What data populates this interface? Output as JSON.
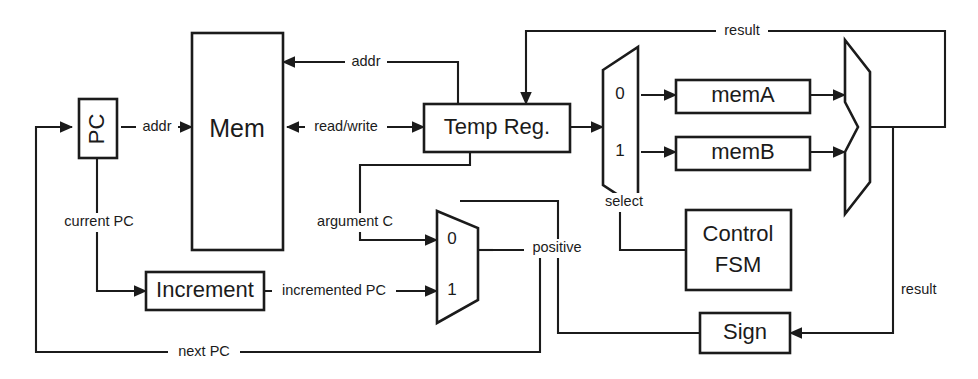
{
  "diagram": {
    "type": "block-diagram",
    "background_color": "#ffffff",
    "line_color": "#1b1b1b",
    "blocks": {
      "pc": {
        "label": "PC",
        "orientation": "vertical-text"
      },
      "mem": {
        "label": "Mem"
      },
      "increment": {
        "label": "Increment"
      },
      "temp_reg": {
        "label": "Temp Reg."
      },
      "mem_a": {
        "label": "memA"
      },
      "mem_b": {
        "label": "memB"
      },
      "control_fsm": {
        "label_line1": "Control",
        "label_line2": "FSM"
      },
      "sign": {
        "label": "Sign"
      },
      "alu": {
        "label": ""
      },
      "mux_data": {
        "input_0": "0",
        "input_1": "1",
        "control_label": "select"
      },
      "mux_pc": {
        "input_0": "0",
        "input_1": "1",
        "control_label": "positive"
      }
    },
    "signals": {
      "addr_pc_to_mem": "addr",
      "addr_temp_to_mem": "addr",
      "read_write": "read/write",
      "current_pc": "current PC",
      "incremented_pc": "incremented PC",
      "next_pc": "next PC",
      "argument_c": "argument C",
      "select": "select",
      "positive": "positive",
      "result_top": "result",
      "result_right": "result"
    }
  }
}
